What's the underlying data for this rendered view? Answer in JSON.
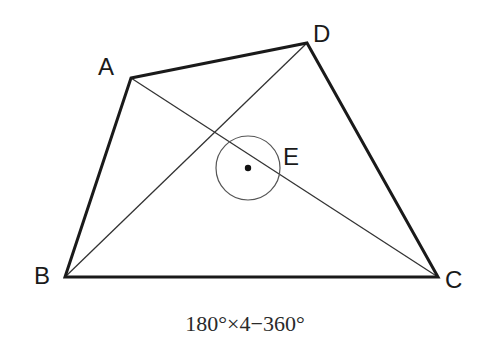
{
  "diagram": {
    "type": "quadrilateral-with-diagonals",
    "points": {
      "A": {
        "label": "A",
        "x": 131,
        "y": 78
      },
      "B": {
        "label": "B",
        "x": 65,
        "y": 277
      },
      "C": {
        "label": "C",
        "x": 438,
        "y": 277
      },
      "D": {
        "label": "D",
        "x": 307,
        "y": 43
      },
      "E": {
        "label": "E",
        "x": 248,
        "y": 168
      }
    },
    "edges": [
      "AD",
      "DC",
      "CB",
      "BA"
    ],
    "diagonals": [
      "AC",
      "BD"
    ],
    "angle_marker": {
      "center": "E",
      "radius": 32,
      "kind": "full-circle"
    },
    "caption": "180°×4−360°",
    "colors": {
      "stroke": "#1a1a1a",
      "thin_stroke": "#333333",
      "circle": "#555555",
      "background": "#ffffff"
    }
  }
}
